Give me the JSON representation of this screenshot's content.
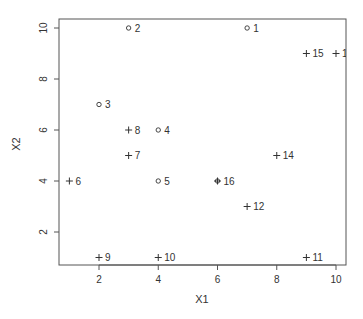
{
  "chart_data": {
    "type": "scatter",
    "title": "",
    "xlabel": "X1",
    "ylabel": "X2",
    "xlim": [
      0.7,
      10.3
    ],
    "ylim": [
      0.65,
      10.35
    ],
    "x_ticks": [
      2,
      4,
      6,
      8,
      10
    ],
    "y_ticks": [
      2,
      4,
      6,
      8,
      10
    ],
    "grid": false,
    "legend": null,
    "series": [
      {
        "name": "class-circle",
        "marker": "circle",
        "points": [
          {
            "label": "1",
            "x": 7,
            "y": 10
          },
          {
            "label": "2",
            "x": 3,
            "y": 10
          },
          {
            "label": "3",
            "x": 2,
            "y": 7
          },
          {
            "label": "4",
            "x": 4,
            "y": 6
          },
          {
            "label": "5",
            "x": 4,
            "y": 4
          },
          {
            "label": "16",
            "x": 6,
            "y": 4
          }
        ]
      },
      {
        "name": "class-plus",
        "marker": "plus",
        "points": [
          {
            "label": "6",
            "x": 1,
            "y": 4
          },
          {
            "label": "7",
            "x": 3,
            "y": 5
          },
          {
            "label": "8",
            "x": 3,
            "y": 6
          },
          {
            "label": "9",
            "x": 2,
            "y": 1
          },
          {
            "label": "10",
            "x": 4,
            "y": 1
          },
          {
            "label": "11",
            "x": 9,
            "y": 1
          },
          {
            "label": "12",
            "x": 7,
            "y": 3
          },
          {
            "label": "14",
            "x": 8,
            "y": 5
          },
          {
            "label": "15",
            "x": 9,
            "y": 9
          },
          {
            "label": "1",
            "x": 10,
            "y": 9
          },
          {
            "label": "16",
            "x": 6,
            "y": 4
          }
        ]
      }
    ]
  },
  "colors": {
    "axis": "#555555",
    "marker": "#333333",
    "text": "#333333"
  }
}
